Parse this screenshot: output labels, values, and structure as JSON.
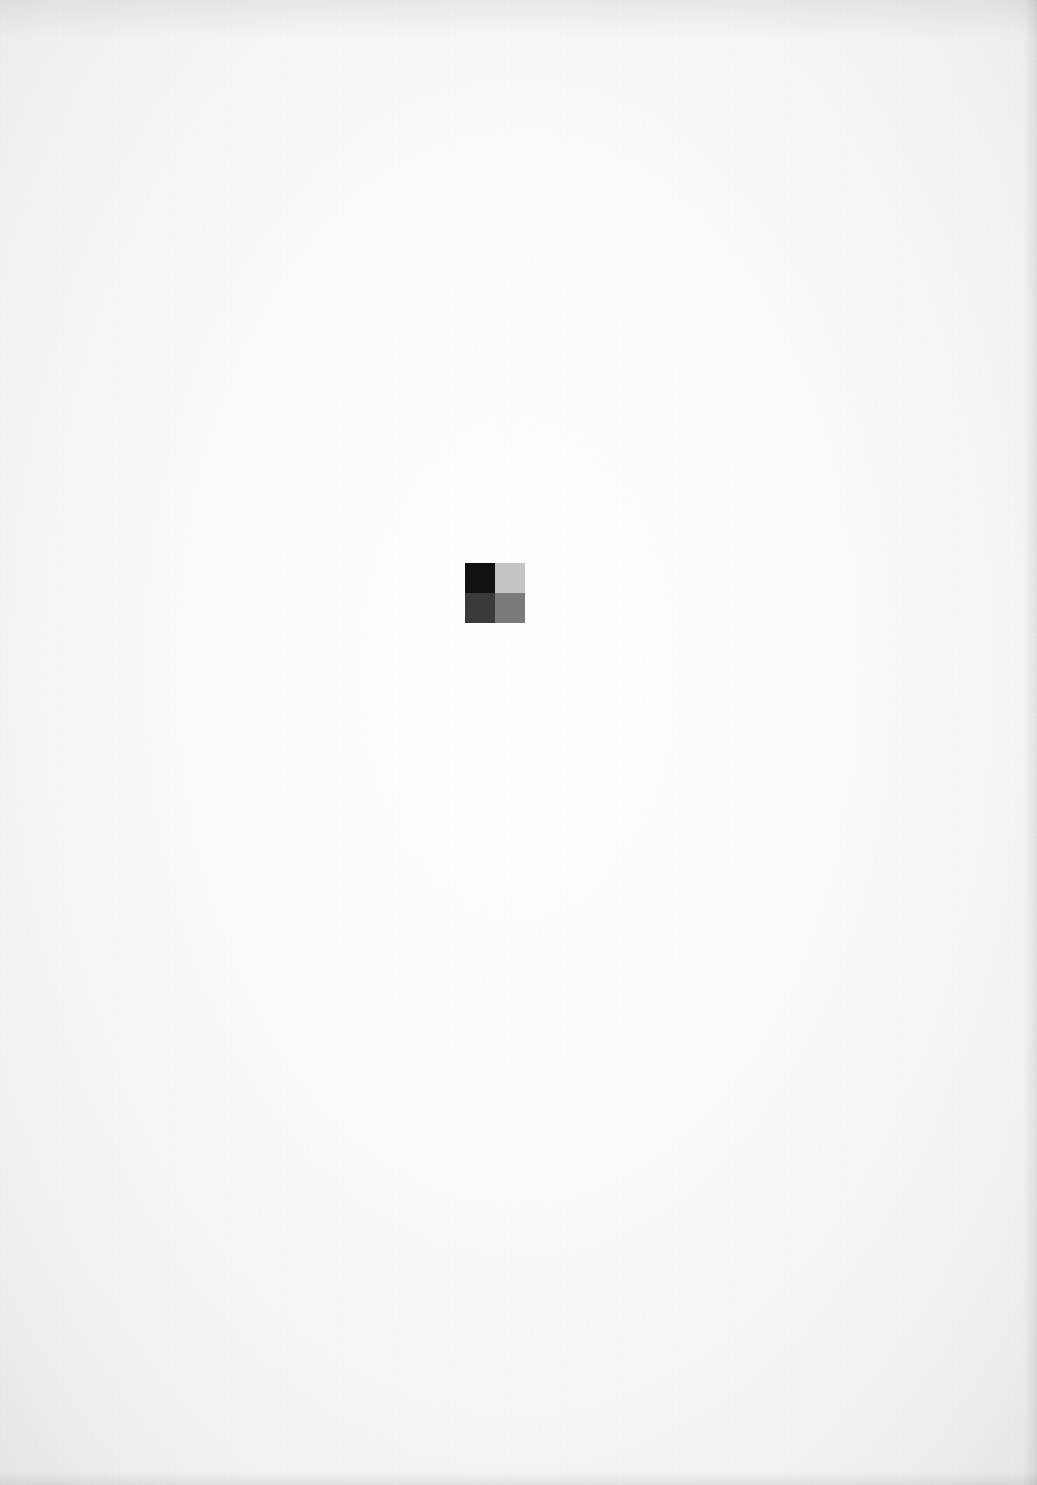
{
  "page": {
    "type": "scanned-blank-page",
    "background_color": "#fbfbfb"
  },
  "swatch": {
    "label": "",
    "cells": [
      {
        "position": "top-left",
        "color": "#111111"
      },
      {
        "position": "top-right",
        "color": "#c4c4c4"
      },
      {
        "position": "bottom-left",
        "color": "#3a3a3a"
      },
      {
        "position": "bottom-right",
        "color": "#7a7a7a"
      }
    ]
  }
}
